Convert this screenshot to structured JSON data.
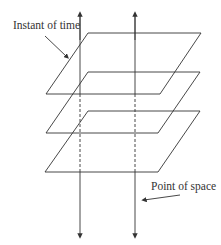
{
  "labels": {
    "instant_of_time": "Instant of time",
    "point_of_space": "Point of space"
  },
  "colors": {
    "stroke": "#333333",
    "background": "#ffffff"
  },
  "planes": [
    {
      "name": "plane-1",
      "top_y": 33,
      "bottom_y": 94
    },
    {
      "name": "plane-2",
      "top_y": 72,
      "bottom_y": 133
    },
    {
      "name": "plane-3",
      "top_y": 111,
      "bottom_y": 172
    }
  ],
  "world_lines": [
    {
      "name": "world-line-left",
      "x": 80
    },
    {
      "name": "world-line-right",
      "x": 135
    }
  ]
}
